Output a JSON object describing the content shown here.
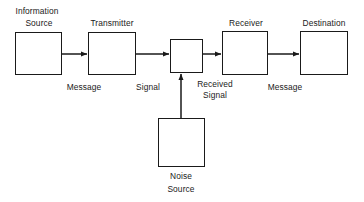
{
  "diagram": {
    "background_color": "#ffffff",
    "stroke_color": "#1a1a1a",
    "boxes": [
      {
        "id": "information-source",
        "label_line1": "Information",
        "label_line2": "Source",
        "x": 15,
        "y": 32,
        "w": 47,
        "h": 43
      },
      {
        "id": "transmitter",
        "label_line1": "Transmitter",
        "label_line2": "",
        "x": 88,
        "y": 32,
        "w": 48,
        "h": 43
      },
      {
        "id": "channel",
        "label_line1": "",
        "label_line2": "",
        "x": 170,
        "y": 39,
        "w": 33,
        "h": 34
      },
      {
        "id": "receiver",
        "label_line1": "Receiver",
        "label_line2": "",
        "x": 222,
        "y": 31,
        "w": 46,
        "h": 44
      },
      {
        "id": "destination",
        "label_line1": "Destination",
        "label_line2": "",
        "x": 300,
        "y": 31,
        "w": 48,
        "h": 44
      },
      {
        "id": "noise-source",
        "label_line1": "Noise",
        "label_line2": "Source",
        "x": 158,
        "y": 118,
        "w": 47,
        "h": 49
      }
    ],
    "box_titles": [
      {
        "id": "title-information",
        "text": "Information",
        "x": 37,
        "y": 6
      },
      {
        "id": "title-source",
        "text": "Source",
        "x": 39,
        "y": 18
      },
      {
        "id": "title-transmitter",
        "text": "Transmitter",
        "x": 112,
        "y": 18
      },
      {
        "id": "title-receiver",
        "text": "Receiver",
        "x": 246,
        "y": 18
      },
      {
        "id": "title-destination",
        "text": "Destination",
        "x": 324,
        "y": 18
      }
    ],
    "signal_labels": [
      {
        "id": "label-message-left",
        "text": "Message",
        "x": 84,
        "y": 82
      },
      {
        "id": "label-signal",
        "text": "Signal",
        "x": 148,
        "y": 82
      },
      {
        "id": "label-received",
        "text": "Received",
        "x": 215,
        "y": 79
      },
      {
        "id": "label-received-signal",
        "text": "Signal",
        "x": 215,
        "y": 90
      },
      {
        "id": "label-message-right",
        "text": "Message",
        "x": 285,
        "y": 82
      }
    ],
    "noise_labels": [
      {
        "id": "label-noise",
        "text": "Noise",
        "x": 181,
        "y": 171
      },
      {
        "id": "label-noise-source",
        "text": "Source",
        "x": 181,
        "y": 184
      }
    ],
    "arrows": [
      {
        "id": "arrow-source-to-transmitter",
        "x1": 62,
        "y1": 54,
        "x2": 88,
        "y2": 54,
        "direction": "right"
      },
      {
        "id": "arrow-transmitter-to-channel",
        "x1": 136,
        "y1": 54,
        "x2": 170,
        "y2": 54,
        "direction": "right"
      },
      {
        "id": "arrow-channel-to-receiver",
        "x1": 203,
        "y1": 54,
        "x2": 222,
        "y2": 54,
        "direction": "right"
      },
      {
        "id": "arrow-receiver-to-destination",
        "x1": 268,
        "y1": 54,
        "x2": 300,
        "y2": 54,
        "direction": "right"
      },
      {
        "id": "arrow-noise-to-channel",
        "x1": 181,
        "y1": 118,
        "x2": 181,
        "y2": 73,
        "direction": "up"
      }
    ]
  }
}
